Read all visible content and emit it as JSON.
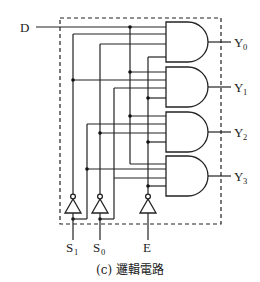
{
  "diagram": {
    "caption": "(c) 邏輯電路",
    "type": "1-to-4 demultiplexer logic circuit",
    "inputs": {
      "data": {
        "label": "D"
      },
      "select1": {
        "label": "S",
        "sub": "1"
      },
      "select0": {
        "label": "S",
        "sub": "0"
      },
      "enable": {
        "label": "E"
      }
    },
    "outputs": [
      {
        "label": "Y",
        "sub": "0"
      },
      {
        "label": "Y",
        "sub": "1"
      },
      {
        "label": "Y",
        "sub": "2"
      },
      {
        "label": "Y",
        "sub": "3"
      }
    ],
    "gates": {
      "and_count": 4,
      "and_inputs_each": 4,
      "inverter_count": 3
    },
    "colors": {
      "line": "#222222",
      "background": "#ffffff"
    }
  }
}
